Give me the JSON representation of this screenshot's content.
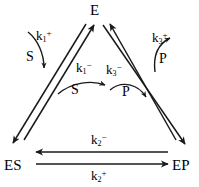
{
  "diagram": {
    "background_color": "#ffffff",
    "stroke_color": "#1a1a1a",
    "nodes": [
      {
        "id": "E",
        "label": "E",
        "position": "top"
      },
      {
        "id": "ES",
        "label": "ES",
        "position": "bottom-left"
      },
      {
        "id": "EP",
        "label": "EP",
        "position": "bottom-right"
      }
    ],
    "rate_constants": [
      {
        "id": "k1_plus",
        "base": "k",
        "subscript": "1",
        "superscript": "+",
        "position": "upper-left"
      },
      {
        "id": "k1_minus",
        "base": "k",
        "subscript": "1",
        "superscript": "−",
        "position": "center-left"
      },
      {
        "id": "k3_plus",
        "base": "k",
        "subscript": "3",
        "superscript": "+",
        "position": "upper-right"
      },
      {
        "id": "k3_minus",
        "base": "k",
        "subscript": "3",
        "superscript": "−",
        "position": "center-right"
      },
      {
        "id": "k2_minus",
        "base": "k",
        "subscript": "2",
        "superscript": "−",
        "position": "bottom-above-arrow"
      },
      {
        "id": "k2_plus",
        "base": "k",
        "subscript": "2",
        "superscript": "+",
        "position": "bottom-below-arrow"
      }
    ],
    "species": [
      {
        "id": "S_left",
        "label": "S",
        "position": "upper-left-curve"
      },
      {
        "id": "S_mid",
        "label": "S",
        "position": "center-left-curve"
      },
      {
        "id": "P_right",
        "label": "P",
        "position": "upper-right-curve"
      },
      {
        "id": "P_mid",
        "label": "P",
        "position": "center-right-curve"
      }
    ],
    "edges": [
      {
        "id": "ES-to-E",
        "from": "ES",
        "to": "E",
        "direction": "up-right"
      },
      {
        "id": "E-to-ES",
        "from": "E",
        "to": "ES",
        "direction": "down-left"
      },
      {
        "id": "EP-to-E",
        "from": "EP",
        "to": "E",
        "direction": "up-left"
      },
      {
        "id": "E-to-EP",
        "from": "E",
        "to": "EP",
        "direction": "down-right"
      },
      {
        "id": "EP-to-ES",
        "from": "EP",
        "to": "ES",
        "direction": "left"
      },
      {
        "id": "ES-to-EP",
        "from": "ES",
        "to": "EP",
        "direction": "right"
      }
    ]
  }
}
